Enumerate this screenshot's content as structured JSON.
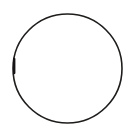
{
  "canvas": {
    "width": 137,
    "height": 138,
    "background_color": "#ffffff",
    "description": "Hand-drawn circle outline on a plain white background"
  },
  "figure": {
    "title": "circle-outline",
    "shape_type": "circle",
    "stroke_color": "#1f1d1c",
    "fill_color": "none",
    "stroke_width": 1.6,
    "center_x": 67.5,
    "center_y": 68.5,
    "radius_x": 54.5,
    "radius_y": 54.5,
    "bounds": {
      "left": 13,
      "top": 14,
      "right": 122,
      "bottom": 123
    },
    "style_note": "slightly irregular, hand-drawn / scanned appearance",
    "accents": [
      {
        "name": "left-edge-thickening",
        "color": "#151313",
        "stroke_width": 2.4,
        "x": 14.2,
        "y1": 59,
        "y2": 73
      },
      {
        "name": "bottom-right-faint-gap",
        "color": "#ffffff",
        "opacity": 0.55,
        "x": 105,
        "y": 117,
        "width": 7,
        "height": 5
      }
    ]
  }
}
